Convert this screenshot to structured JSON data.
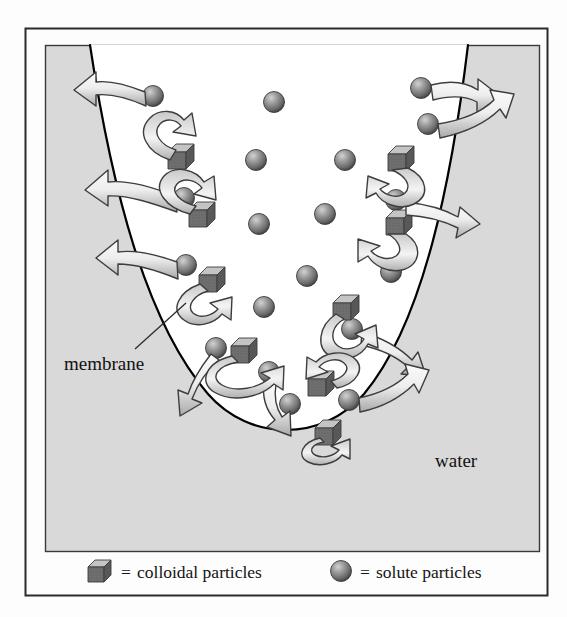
{
  "figure": {
    "type": "diagram",
    "frame": {
      "outer_border_color": "#2b2b2b",
      "page_background": "#fdfdfd",
      "panel_background": "#d9d9d9",
      "panel_border_color": "#3a3a3a",
      "interior_background": "#ffffff",
      "membrane_line_color": "#000000"
    },
    "labels": {
      "membrane": "membrane",
      "water": "water"
    },
    "legend": {
      "items": [
        {
          "icon": "cube-icon",
          "equals": "=",
          "label": "colloidal particles"
        },
        {
          "icon": "sphere-icon",
          "equals": "=",
          "label": "solute particles"
        }
      ]
    },
    "colors": {
      "sphere_light": "#b9b9b9",
      "sphere_mid": "#8a8a8a",
      "sphere_dark": "#4e4e4e",
      "cube_top": "#bdbdbd",
      "cube_front": "#6f6f6f",
      "cube_side": "#555555",
      "arrow_fill_light": "#f2f2f2",
      "arrow_fill_mid": "#b4b4b4",
      "arrow_stroke": "#3d3d3d",
      "text": "#111111"
    },
    "counts": {
      "solute_particles_total": 21,
      "colloidal_particles_total": 9,
      "outward_arrows": 9,
      "rebound_arrows": 8
    },
    "solute_particles": [
      {
        "cx": 153,
        "cy": 96,
        "r": 10
      },
      {
        "cx": 274,
        "cy": 102,
        "r": 10
      },
      {
        "cx": 184,
        "cy": 198,
        "r": 10
      },
      {
        "cx": 256,
        "cy": 160,
        "r": 10
      },
      {
        "cx": 344,
        "cy": 160,
        "r": 10
      },
      {
        "cx": 183,
        "cy": 265,
        "r": 10
      },
      {
        "cx": 259,
        "cy": 224,
        "r": 10
      },
      {
        "cx": 325,
        "cy": 214,
        "r": 10
      },
      {
        "cx": 264,
        "cy": 307,
        "r": 10
      },
      {
        "cx": 216,
        "cy": 348,
        "r": 10
      },
      {
        "cx": 264,
        "cy": 370,
        "r": 10
      },
      {
        "cx": 307,
        "cy": 276,
        "r": 10
      },
      {
        "cx": 290,
        "cy": 404,
        "r": 10
      },
      {
        "cx": 352,
        "cy": 329,
        "r": 10
      },
      {
        "cx": 349,
        "cy": 400,
        "r": 10
      },
      {
        "cx": 396,
        "cy": 274,
        "r": 10
      },
      {
        "cx": 389,
        "cy": 200,
        "r": 10
      },
      {
        "cx": 421,
        "cy": 88,
        "r": 10
      },
      {
        "cx": 428,
        "cy": 124,
        "r": 10
      },
      {
        "cx": 203,
        "cy": 309,
        "r": 10
      },
      {
        "cx": 247,
        "cy": 232,
        "r": 10
      }
    ],
    "colloidal_particles": [
      {
        "cx": 180,
        "cy": 156,
        "s": 12
      },
      {
        "cx": 200,
        "cy": 214,
        "s": 12
      },
      {
        "cx": 209,
        "cy": 275,
        "s": 12
      },
      {
        "cx": 241,
        "cy": 350,
        "s": 12
      },
      {
        "cx": 318,
        "cy": 383,
        "s": 12
      },
      {
        "cx": 346,
        "cy": 307,
        "s": 12
      },
      {
        "cx": 399,
        "cy": 158,
        "s": 12
      },
      {
        "cx": 397,
        "cy": 222,
        "s": 12
      },
      {
        "cx": 325,
        "cy": 433,
        "s": 12
      }
    ]
  }
}
